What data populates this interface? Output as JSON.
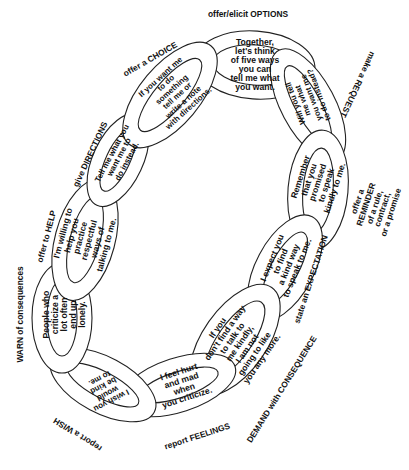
{
  "diagram": {
    "type": "chain of communication strategies",
    "links": [
      {
        "id": "options",
        "category": "offer/elicit OPTIONS",
        "text": "Together,\nlet's think\nof five ways\nyou can\ntell me what\nyou want."
      },
      {
        "id": "request",
        "category": "make a REQUEST",
        "text": "Will you tell\nme what\nyou want me\nto do instead?"
      },
      {
        "id": "reminder",
        "category": "offer a REMINDER\nof a rule, contract,\nor a promise",
        "text": "Remember\nthat you\npromised\nto speak\nkindly to me."
      },
      {
        "id": "expectation",
        "category": "state an EXPECTATION",
        "text": "I expect you\nto find\na kind way\nto speak to me."
      },
      {
        "id": "consequence",
        "category": "DEMAND with CONSEQUENCE",
        "text": "If you\ndon't find a way\nto talk to\nme kindly,\nI am not\ngoing to like\nyou any more."
      },
      {
        "id": "feelings",
        "category": "report FEELINGS",
        "text": "I feel hurt\nand mad\nwhen\nyou criticize."
      },
      {
        "id": "wish",
        "category": "report a WISH",
        "text": "I wish you\nwould\nbe kind\nto me."
      },
      {
        "id": "warn",
        "category": "WARN of consequences",
        "text": "People who\ncriticize a\nlot often\nend up\nlonely."
      },
      {
        "id": "help",
        "category": "offer to HELP",
        "text": "I'm willing to\nhelp you\npractice\nrespectful\nways of\ntalking to me."
      },
      {
        "id": "directions",
        "category": "give DIRECTIONS",
        "text": "Tell me what you\nwant me to\ndo instead."
      },
      {
        "id": "choice",
        "category": "offer a CHOICE",
        "text": "If you want me\nto do\nsomething\ntell me or\nwrite a note\nwith directions."
      }
    ]
  },
  "colors": {
    "stroke": "#222222",
    "fill": "#ffffff",
    "text": "#111111"
  }
}
